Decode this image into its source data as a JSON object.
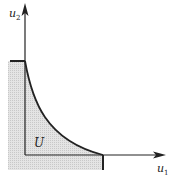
{
  "diagram": {
    "type": "utility-possibility-set",
    "axes": {
      "x_label": "u",
      "x_sub": "1",
      "y_label": "u",
      "y_sub": "2"
    },
    "region_label": "U",
    "colors": {
      "line": "#222222",
      "fill": "#d9d9d9",
      "background": "#ffffff"
    }
  }
}
